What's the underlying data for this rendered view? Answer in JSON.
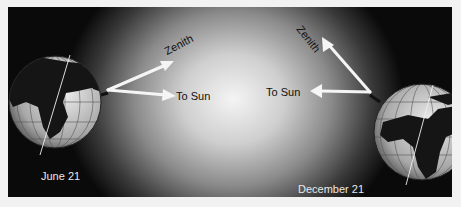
{
  "diagram": {
    "left_scene": {
      "date_label": "June 21",
      "zenith_label": "Zenith",
      "sun_label": "To Sun"
    },
    "right_scene": {
      "date_label": "December 21",
      "zenith_label": "Zenith",
      "sun_label": "To Sun"
    },
    "colors": {
      "background_dark": "#0a0a0a",
      "background_center": "#f4f4f4",
      "arrow": "#f5f5f5",
      "ocean": "#d8d8d8",
      "land": "#151515"
    }
  }
}
